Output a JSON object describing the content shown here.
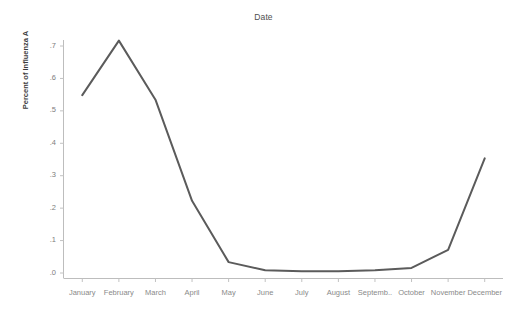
{
  "chart_data": {
    "type": "line",
    "title": "Date",
    "xlabel": "",
    "ylabel": "Percent of Influenza A",
    "categories": [
      "January",
      "February",
      "March",
      "April",
      "May",
      "June",
      "July",
      "August",
      "Septemb..",
      "October",
      "November",
      "December"
    ],
    "x_tick_labels": [
      "January",
      "February",
      "March",
      "April",
      "May",
      "June",
      "July",
      "August",
      "Septemb..",
      "October",
      "November",
      "December"
    ],
    "y_tick_labels": [
      ".0",
      ".1",
      ".2",
      ".3",
      ".4",
      ".5",
      ".6",
      ".7"
    ],
    "y_tick_values": [
      0.0,
      0.1,
      0.2,
      0.3,
      0.4,
      0.5,
      0.6,
      0.7
    ],
    "ylim": [
      0.0,
      0.72
    ],
    "grid": false,
    "legend": false,
    "series": [
      {
        "name": "Percent of Influenza A",
        "color": "#5b5b5b",
        "values": [
          0.547,
          0.715,
          0.533,
          0.221,
          0.032,
          0.007,
          0.004,
          0.004,
          0.007,
          0.014,
          0.07,
          0.352
        ]
      }
    ],
    "axis_color": "#b4b4b4",
    "line_width": 2
  },
  "axes": {
    "y_axis_title": "Percent of Influenza A"
  }
}
